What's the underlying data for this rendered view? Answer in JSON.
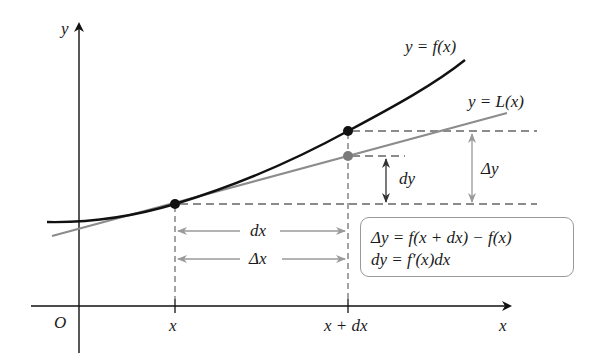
{
  "diagram": {
    "axes": {
      "x_label": "x",
      "y_label": "y",
      "origin_label": "O"
    },
    "curves": {
      "f_label": "y = f(x)",
      "L_label": "y = L(x)"
    },
    "ticks": {
      "x_tick": "x",
      "x_dx_tick": "x + dx"
    },
    "annotations": {
      "dx": "dx",
      "delta_x": "Δx",
      "dy": "dy",
      "delta_y": "Δy"
    },
    "formula_box": {
      "line1": "Δy = f(x + dx) − f(x)",
      "line2": "dy = f′(x)dx"
    },
    "colors": {
      "curve": "#111111",
      "tangent": "#8c8c8c",
      "dashed": "#666666",
      "arrow_gray": "#a0a0a0",
      "box_border": "#9a9a9a"
    }
  }
}
